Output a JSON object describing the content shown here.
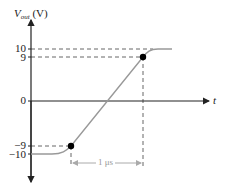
{
  "diagram": {
    "y_axis": {
      "label_main": "V",
      "label_sub": "out",
      "label_unit": " (V)",
      "ticks": [
        {
          "value": 10,
          "label": "10"
        },
        {
          "value": 9,
          "label": "9"
        },
        {
          "value": 0,
          "label": "0"
        },
        {
          "value": -9,
          "label": "−9"
        },
        {
          "value": -10,
          "label": "−10"
        }
      ]
    },
    "x_axis": {
      "label": "t"
    },
    "points": [
      {
        "name": "lower-10pct",
        "value": -9
      },
      {
        "name": "upper-90pct",
        "value": 9
      }
    ],
    "dimension": {
      "label": "1 μs"
    },
    "colors": {
      "axis": "#222222",
      "curve": "#999999",
      "dashed": "#666666",
      "dimension": "#aaaaaa",
      "point": "#000000"
    }
  }
}
